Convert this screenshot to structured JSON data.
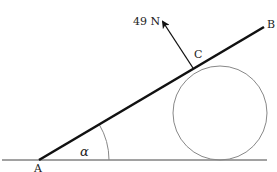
{
  "diagram": {
    "type": "statics",
    "labels": {
      "A": "A",
      "B": "B",
      "C": "C",
      "force": "49 N",
      "angle": "α"
    },
    "points": {
      "A": [
        39,
        160
      ],
      "B": [
        264,
        27
      ],
      "C": [
        193,
        68
      ],
      "force_tip": [
        162,
        21
      ]
    },
    "circle": {
      "cx": 220,
      "cy": 113,
      "r": 47
    },
    "ground": {
      "x1": 2,
      "x2": 267,
      "y": 160
    },
    "angle_arc_radius": 70,
    "colors": {
      "rod": "#111111",
      "ground": "#444444",
      "circle": "#888888",
      "arrow": "#111111",
      "text": "#222222"
    }
  }
}
